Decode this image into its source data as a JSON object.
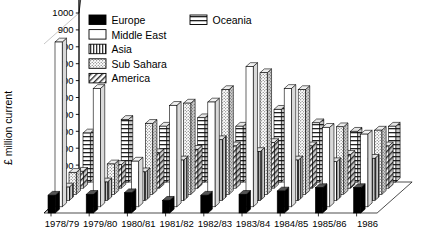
{
  "chart_data": {
    "type": "bar",
    "title": "",
    "subtitle": "",
    "xlabel": "",
    "ylabel": "£ million current",
    "ylim": [
      0,
      1050
    ],
    "yticks": [
      100,
      200,
      300,
      400,
      500,
      600,
      700,
      800,
      900,
      1000
    ],
    "grid": false,
    "legend_position": "top-right",
    "projection": "3d-isometric",
    "categories": [
      "1978/79",
      "1979/80",
      "1980/81",
      "1981/82",
      "1982/83",
      "1983/84",
      "1984/85",
      "1985/86",
      "1986"
    ],
    "series": [
      {
        "name": "Europe",
        "fill": "solid-black",
        "color": "#000000",
        "values": [
          105,
          110,
          120,
          75,
          105,
          110,
          130,
          150,
          150
        ]
      },
      {
        "name": "Middle East",
        "fill": "white",
        "color": "#ffffff",
        "values": [
          975,
          700,
          270,
          600,
          620,
          830,
          700,
          470,
          430
        ]
      },
      {
        "name": "Asia",
        "fill": "vertical-stripes",
        "color": "#b0b0b0",
        "values": [
          80,
          110,
          170,
          240,
          360,
          290,
          240,
          230,
          250
        ]
      },
      {
        "name": "Sub Sahara",
        "fill": "stipple",
        "color": "#d8d8d8",
        "values": [
          130,
          180,
          420,
          540,
          620,
          720,
          620,
          400,
          380
        ]
      },
      {
        "name": "America",
        "fill": "diagonal-hatch",
        "color": "#e8e8e8",
        "values": [
          100,
          140,
          210,
          230,
          250,
          270,
          250,
          200,
          250
        ]
      },
      {
        "name": "Oceania",
        "fill": "horizontal-lines",
        "color": "#c8c8c8",
        "values": [
          290,
          370,
          330,
          380,
          330,
          430,
          350,
          300,
          330
        ]
      }
    ]
  },
  "legend": {
    "items": [
      {
        "label": "Europe",
        "swatch": "solid-black"
      },
      {
        "label": "Middle East",
        "swatch": "white"
      },
      {
        "label": "Asia",
        "swatch": "vertical-stripes"
      },
      {
        "label": "Sub Sahara",
        "swatch": "stipple"
      },
      {
        "label": "America",
        "swatch": "diagonal-hatch"
      },
      {
        "label": "Oceania",
        "swatch": "horizontal-lines"
      }
    ]
  },
  "axis": {
    "y_title": "£ million current",
    "y_tick_labels": [
      "1000",
      "900",
      "800",
      "700",
      "600",
      "500",
      "400",
      "300",
      "200",
      "100"
    ],
    "x_tick_labels": [
      "1978/79",
      "1979/80",
      "1980/81",
      "1981/82",
      "1982/83",
      "1983/84",
      "1984/85",
      "1985/86",
      "1986"
    ]
  },
  "colors": {
    "ink": "#000000",
    "paper": "#ffffff",
    "bar_side": "#bdbdbd",
    "bar_top": "#e6e6e6"
  }
}
